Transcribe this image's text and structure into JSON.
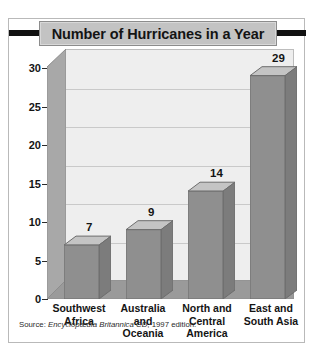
{
  "figure": {
    "title": "Number of Hurricanes in a Year",
    "source_prefix": "Source: ",
    "source_italic": "Encyclopædia Britannica CD",
    "source_suffix": ", 1997 edition."
  },
  "colors": {
    "title_band": "#c3c3c3",
    "title_rule": "#111111",
    "bar_face": "#8f8f8f",
    "bar_top": "#c4c4c4",
    "bar_side": "#7c7c7c",
    "back_wall": "#eeeeee",
    "left_wall": "#a8a8a8",
    "floor": "#9a9a9a",
    "gridline": "#c9c9c9",
    "frame_border": "#b9b9b9",
    "text": "#141414"
  },
  "chart_data": {
    "type": "bar",
    "title": "Number of Hurricanes in a Year",
    "xlabel": "",
    "ylabel": "",
    "categories": [
      "Southwest Africa",
      "Australia and Oceania",
      "North and Central America",
      "East and South Asia"
    ],
    "category_lines": [
      [
        "Southwest",
        "Africa"
      ],
      [
        "Australia",
        "and",
        "Oceania"
      ],
      [
        "North and",
        "Central",
        "America"
      ],
      [
        "East and",
        "South Asia"
      ]
    ],
    "values": [
      7,
      9,
      14,
      29
    ],
    "data_labels": [
      "7",
      "9",
      "14",
      "29"
    ],
    "ylim": [
      0,
      30
    ],
    "yticks": [
      0,
      5,
      10,
      15,
      20,
      25,
      30
    ],
    "ytick_labels": [
      "0",
      "5",
      "10",
      "15",
      "20",
      "25",
      "30"
    ],
    "grid": true,
    "legend": false,
    "three_d": true
  }
}
